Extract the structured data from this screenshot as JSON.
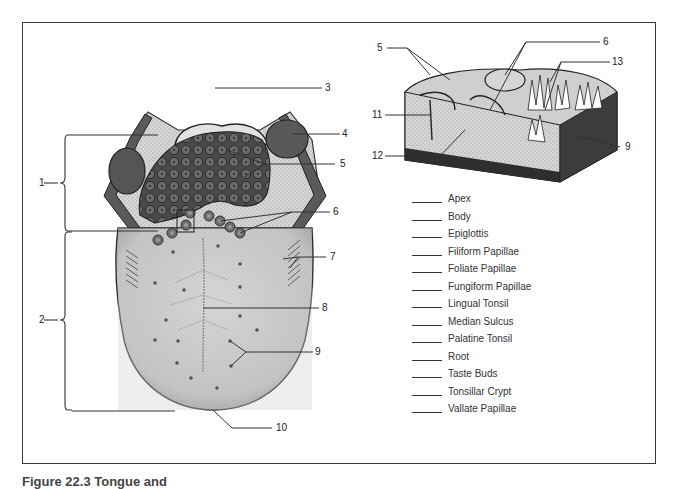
{
  "figure": {
    "caption_visible_fragment": "Figure 22.3  Tongue and",
    "callouts": [
      {
        "id": "1",
        "label": "1"
      },
      {
        "id": "2",
        "label": "2"
      },
      {
        "id": "3",
        "label": "3"
      },
      {
        "id": "4",
        "label": "4"
      },
      {
        "id": "5",
        "label": "5"
      },
      {
        "id": "6",
        "label": "6"
      },
      {
        "id": "7",
        "label": "7"
      },
      {
        "id": "8",
        "label": "8"
      },
      {
        "id": "9",
        "label": "9"
      },
      {
        "id": "10",
        "label": "10"
      }
    ],
    "inset_callouts": [
      {
        "id": "5",
        "label": "5"
      },
      {
        "id": "6",
        "label": "6"
      },
      {
        "id": "13",
        "label": "13"
      },
      {
        "id": "11",
        "label": "11"
      },
      {
        "id": "12",
        "label": "12"
      },
      {
        "id": "9",
        "label": "9"
      }
    ],
    "term_list": [
      "Apex",
      "Body",
      "Epiglottis",
      "Filiform Papillae",
      "Foliate Papillae",
      "Fungiform Papillae",
      "Lingual Tonsil",
      "Median Sulcus",
      "Palatine Tonsil",
      "Root",
      "Taste Buds",
      "Tonsillar Crypt",
      "Vallate Papillae"
    ]
  }
}
